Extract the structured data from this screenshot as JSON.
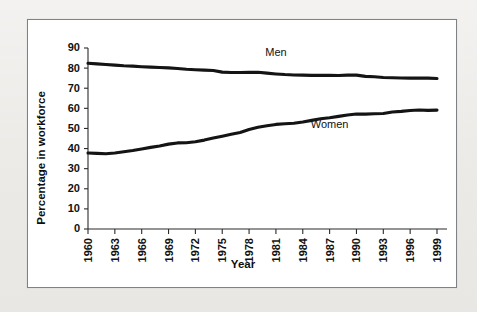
{
  "chart_data": {
    "type": "line",
    "title": "",
    "xlabel": "Year",
    "ylabel": "Percentage in workforce",
    "xlim": [
      1960,
      1999
    ],
    "ylim": [
      0,
      90
    ],
    "grid": false,
    "legend_position": "inline",
    "x_ticks": [
      "1960",
      "1963",
      "1966",
      "1969",
      "1972",
      "1975",
      "1978",
      "1981",
      "1984",
      "1987",
      "1990",
      "1993",
      "1996",
      "1999"
    ],
    "y_ticks": [
      "0",
      "10",
      "20",
      "30",
      "40",
      "50",
      "60",
      "70",
      "80",
      "90"
    ],
    "x": [
      1960,
      1961,
      1962,
      1963,
      1964,
      1965,
      1966,
      1967,
      1968,
      1969,
      1970,
      1971,
      1972,
      1973,
      1974,
      1975,
      1976,
      1977,
      1978,
      1979,
      1980,
      1981,
      1982,
      1983,
      1984,
      1985,
      1986,
      1987,
      1988,
      1989,
      1990,
      1991,
      1992,
      1993,
      1994,
      1995,
      1996,
      1997,
      1998,
      1999
    ],
    "series": [
      {
        "name": "Men",
        "color": "#141414",
        "label_x": 1981,
        "label_y": 86,
        "values": [
          82.4,
          82.1,
          81.8,
          81.5,
          81.2,
          81.0,
          80.7,
          80.5,
          80.3,
          80.1,
          79.8,
          79.4,
          79.2,
          79.0,
          78.8,
          78.0,
          77.8,
          77.8,
          77.9,
          77.9,
          77.5,
          77.1,
          76.8,
          76.6,
          76.5,
          76.4,
          76.4,
          76.4,
          76.3,
          76.5,
          76.5,
          75.9,
          75.7,
          75.3,
          75.2,
          75.1,
          75.0,
          75.1,
          75.0,
          74.8
        ]
      },
      {
        "name": "Women",
        "color": "#141414",
        "label_x": 1987,
        "label_y": 50,
        "values": [
          37.8,
          37.6,
          37.4,
          37.8,
          38.4,
          39.0,
          39.8,
          40.6,
          41.3,
          42.2,
          42.8,
          42.9,
          43.4,
          44.2,
          45.2,
          46.1,
          47.1,
          48.0,
          49.5,
          50.6,
          51.3,
          52.0,
          52.3,
          52.6,
          53.2,
          54.0,
          54.8,
          55.3,
          56.0,
          56.7,
          57.2,
          57.1,
          57.3,
          57.4,
          58.2,
          58.5,
          58.9,
          59.2,
          59.0,
          59.1
        ]
      }
    ]
  }
}
